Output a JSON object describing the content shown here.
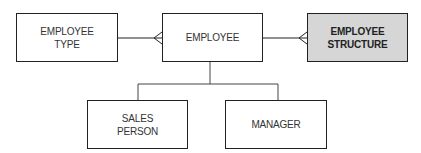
{
  "diagram": {
    "type": "entity-relationship",
    "entities": [
      {
        "id": "employee_type",
        "label": "EMPLOYEE\nTYPE",
        "highlighted": false
      },
      {
        "id": "employee",
        "label": "EMPLOYEE",
        "highlighted": false
      },
      {
        "id": "employee_structure",
        "label": "EMPLOYEE\nSTRUCTURE",
        "highlighted": true
      },
      {
        "id": "sales_person",
        "label": "SALES\nPERSON",
        "highlighted": false
      },
      {
        "id": "manager",
        "label": "MANAGER",
        "highlighted": false
      }
    ],
    "relationships": [
      {
        "from": "employee_type",
        "to": "employee",
        "cardinality": "one-to-many"
      },
      {
        "from": "employee",
        "to": "employee_structure",
        "cardinality": "one-to-many"
      },
      {
        "from": "employee",
        "to": "sales_person",
        "kind": "subtype"
      },
      {
        "from": "employee",
        "to": "manager",
        "kind": "subtype"
      }
    ],
    "colors": {
      "highlight_fill": "#d6d6d6",
      "line": "#222222"
    }
  }
}
